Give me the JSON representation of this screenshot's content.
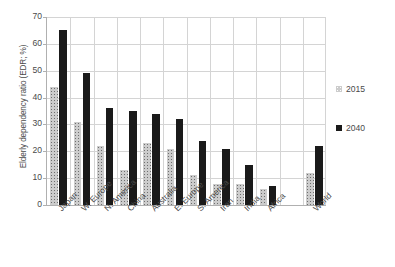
{
  "chart_data": {
    "type": "bar",
    "title": "",
    "subtitle": "",
    "xlabel": "",
    "ylabel": "Elderly dependency ratio (EDR; %)",
    "ylim": [
      0,
      70
    ],
    "yticks": [
      0,
      10,
      20,
      30,
      40,
      50,
      60,
      70
    ],
    "ytick_labels": [
      "0",
      "10",
      "20",
      "30",
      "40",
      "50",
      "60",
      "70"
    ],
    "grid": "horizontal-and-vertical",
    "legend_position": "right",
    "categories": [
      "Japan",
      "W. Europe",
      "N. America",
      "China",
      "Australia",
      "E. Europe",
      "S. America",
      "Iran",
      "India",
      "Africa",
      "World"
    ],
    "series": [
      {
        "name": "2015",
        "color": "#cccccc",
        "values": [
          44,
          31,
          22,
          13,
          23,
          21,
          11,
          8,
          8,
          6,
          12
        ]
      },
      {
        "name": "2040",
        "color": "#1a1a1a",
        "values": [
          65,
          49,
          36,
          35,
          34,
          32,
          24,
          21,
          15,
          7,
          22
        ]
      }
    ],
    "annotations": [],
    "note": "World group separated by a gap from the regional groups"
  },
  "legend": {
    "items": [
      {
        "label": "2015",
        "swatch": "speckled-gray-square"
      },
      {
        "label": "2040",
        "swatch": "solid-black-square"
      }
    ]
  }
}
